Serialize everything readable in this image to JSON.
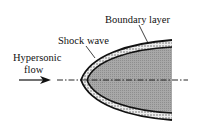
{
  "labels": {
    "boundary_layer": "Boundary layer",
    "shock_wave": "Shock wave",
    "flow_line1": "Hypersonic",
    "flow_line2": "flow"
  },
  "colors": {
    "body_fill": "#a9a9a9",
    "layer_fill": "#e4e4e4",
    "line": "#111111"
  }
}
